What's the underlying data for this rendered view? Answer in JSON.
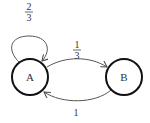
{
  "diagram": {
    "type": "markov-chain",
    "nodes": [
      {
        "id": "A",
        "label": "A"
      },
      {
        "id": "B",
        "label": "B"
      }
    ],
    "edges": [
      {
        "from": "A",
        "to": "A",
        "num": "2",
        "den": "3"
      },
      {
        "from": "A",
        "to": "B",
        "num": "1",
        "den": "3"
      },
      {
        "from": "B",
        "to": "A",
        "label": "1"
      }
    ],
    "colors": {
      "stroke": "#111111",
      "arrow": "#444444",
      "text": "#333333"
    }
  }
}
